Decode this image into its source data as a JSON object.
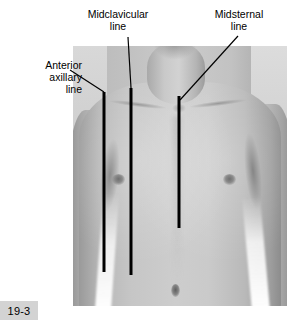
{
  "figure": {
    "badge": "19-3",
    "alt_description": "Anterior chest of a male showing anatomical reference lines",
    "background_color": "#ffffff",
    "line_color": "#000000",
    "badge_background": "#d3d3d3"
  },
  "labels": {
    "anterior_axillary": "Anterior\naxillary\nline",
    "midclavicular": "Midclavicular\nline",
    "midsternal": "Midsternal\nline"
  },
  "reference_lines": [
    {
      "name": "anterior-axillary-line",
      "label": "Anterior axillary line",
      "marker": {
        "x": 104,
        "y_top": 92,
        "y_bottom": 272,
        "width": 3
      },
      "leader": {
        "x1": 70,
        "y1": 70,
        "x2": 104,
        "y2": 92
      }
    },
    {
      "name": "midclavicular-line",
      "label": "Midclavicular line",
      "marker": {
        "x": 131,
        "y_top": 88,
        "y_bottom": 275,
        "width": 3
      },
      "leader": {
        "x1": 128,
        "y1": 37,
        "x2": 131,
        "y2": 88
      }
    },
    {
      "name": "midsternal-line",
      "label": "Midsternal line",
      "marker": {
        "x": 179,
        "y_top": 96,
        "y_bottom": 228,
        "width": 3
      },
      "leader": {
        "x1": 238,
        "y1": 36,
        "x2": 180,
        "y2": 100
      }
    }
  ],
  "photo": {
    "left": 73,
    "top": 46,
    "width": 214,
    "height": 260
  }
}
